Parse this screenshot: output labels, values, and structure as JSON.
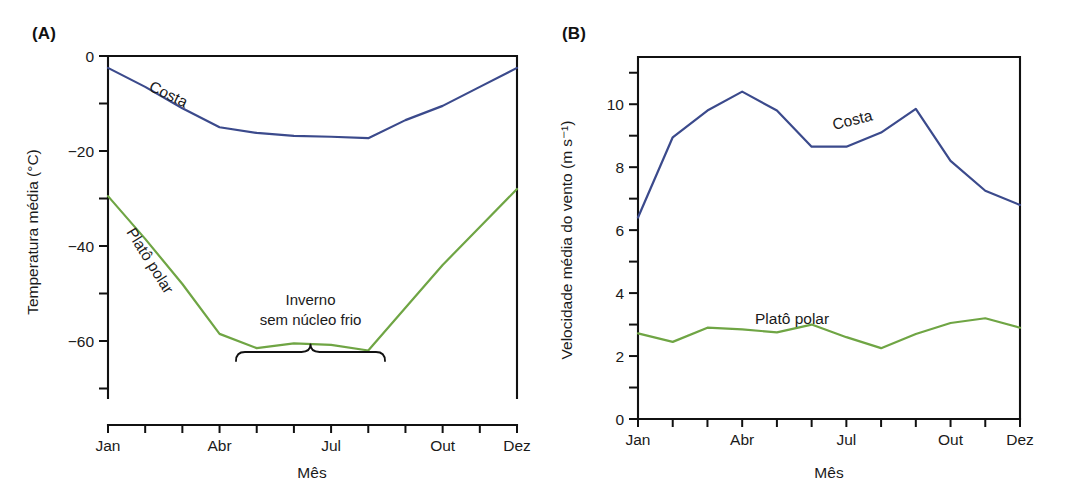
{
  "figure": {
    "panels": [
      {
        "key": "A",
        "label": "(A)",
        "xlabel": "Mês",
        "ylabel": "Temperatura média (°C)"
      },
      {
        "key": "B",
        "label": "(B)",
        "xlabel": "Mês",
        "ylabel": "Velocidade média do vento (m s⁻¹)"
      }
    ]
  },
  "colors": {
    "costa": "#3b4a8c",
    "plato": "#6fa544",
    "axis": "#111111",
    "text": "#1a1a1a",
    "background": "#ffffff"
  },
  "chart_data": [
    {
      "type": "line",
      "panel": "(A)",
      "title": "",
      "xlabel": "Mês",
      "ylabel": "Temperatura média (°C)",
      "categories": [
        "Jan",
        "Fev",
        "Mar",
        "Abr",
        "Mai",
        "Jun",
        "Jul",
        "Ago",
        "Set",
        "Out",
        "Nov",
        "Dez"
      ],
      "x_tick_labels": [
        "Jan",
        "",
        "",
        "Abr",
        "",
        "",
        "Jul",
        "",
        "",
        "Out",
        "",
        "Dez"
      ],
      "y_tick_labels": [
        "0",
        "",
        "−20",
        "",
        "−40",
        "",
        "−60",
        ""
      ],
      "y_ticks_major": [
        0,
        -20,
        -40,
        -60
      ],
      "y_ticks_minor": [
        -10,
        -30,
        -50,
        -70
      ],
      "ylim": [
        -72,
        0
      ],
      "xlim": [
        1,
        12
      ],
      "grid": false,
      "legend": "inline-labels",
      "series": [
        {
          "name": "Costa",
          "color": "#3b4a8c",
          "values": [
            -2.5,
            -6.5,
            -11.0,
            -15.0,
            -16.2,
            -16.8,
            -17.0,
            -17.3,
            -13.5,
            -10.5,
            -6.5,
            -2.5
          ]
        },
        {
          "name": "Platô polar",
          "color": "#6fa544",
          "values": [
            -29.5,
            -38.5,
            -48.0,
            -58.5,
            -61.5,
            -60.5,
            -60.8,
            -62.0,
            -53.0,
            -44.0,
            -36.0,
            -28.0
          ]
        }
      ],
      "annotations": [
        {
          "name": "inverno-annotation",
          "lines": [
            "Inverno",
            "sem núcleo frio"
          ],
          "brace_from": "Abr",
          "brace_to": "Ago"
        }
      ]
    },
    {
      "type": "line",
      "panel": "(B)",
      "title": "",
      "xlabel": "Mês",
      "ylabel": "Velocidade média do vento (m s⁻¹)",
      "categories": [
        "Jan",
        "Fev",
        "Mar",
        "Abr",
        "Mai",
        "Jun",
        "Jul",
        "Ago",
        "Set",
        "Out",
        "Nov",
        "Dez"
      ],
      "x_tick_labels": [
        "Jan",
        "",
        "",
        "Abr",
        "",
        "",
        "Jul",
        "",
        "",
        "Out",
        "",
        "Dez"
      ],
      "y_tick_labels": [
        "0",
        "",
        "2",
        "",
        "4",
        "",
        "6",
        "",
        "8",
        "",
        "10",
        ""
      ],
      "y_ticks_major": [
        0,
        2,
        4,
        6,
        8,
        10
      ],
      "y_ticks_minor": [
        1,
        3,
        5,
        7,
        9,
        11
      ],
      "ylim": [
        0,
        11.5
      ],
      "xlim": [
        1,
        12
      ],
      "grid": false,
      "legend": "inline-labels",
      "series": [
        {
          "name": "Costa",
          "color": "#3b4a8c",
          "values": [
            6.4,
            8.95,
            9.8,
            10.4,
            9.8,
            8.65,
            8.65,
            9.1,
            9.85,
            8.2,
            7.25,
            6.8
          ]
        },
        {
          "name": "Platô polar",
          "color": "#6fa544",
          "values": [
            2.72,
            2.45,
            2.9,
            2.85,
            2.75,
            3.0,
            2.6,
            2.25,
            2.7,
            3.05,
            3.2,
            2.9
          ]
        }
      ],
      "annotations": []
    }
  ]
}
